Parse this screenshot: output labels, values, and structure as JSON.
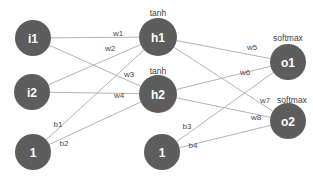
{
  "diagram": {
    "type": "neural-network-graph",
    "title": "",
    "background_color": "#ffffff",
    "node_fill_color": "#5d5d5d",
    "node_text_color": "#ffffff",
    "edge_color": "#b4b4b4",
    "label_color": "#4a4a4a",
    "nodes": [
      {
        "id": "i1",
        "label": "i1",
        "layer": "input",
        "cx": 33,
        "cy": 38,
        "r": 18
      },
      {
        "id": "i2",
        "label": "i2",
        "layer": "input",
        "cx": 32,
        "cy": 92,
        "r": 18
      },
      {
        "id": "b1",
        "label": "1",
        "layer": "bias",
        "cx": 33,
        "cy": 152,
        "r": 18
      },
      {
        "id": "h1",
        "label": "h1",
        "layer": "hidden",
        "cx": 158,
        "cy": 37,
        "r": 19
      },
      {
        "id": "h2",
        "label": "h2",
        "layer": "hidden",
        "cx": 158,
        "cy": 94,
        "r": 19
      },
      {
        "id": "b2",
        "label": "1",
        "layer": "bias",
        "cx": 162,
        "cy": 152,
        "r": 18
      },
      {
        "id": "o1",
        "label": "o1",
        "layer": "output",
        "cx": 288,
        "cy": 62,
        "r": 18
      },
      {
        "id": "o2",
        "label": "o2",
        "layer": "output",
        "cx": 288,
        "cy": 121,
        "r": 18
      }
    ],
    "activations": [
      {
        "for": "h1",
        "text": "tanh",
        "x": 158,
        "y": 13
      },
      {
        "for": "h2",
        "text": "tanh",
        "x": 158,
        "y": 71
      },
      {
        "for": "o1",
        "text": "softmax",
        "x": 288,
        "y": 38
      },
      {
        "for": "o2",
        "text": "softmax",
        "x": 292,
        "y": 100
      }
    ],
    "edges": [
      {
        "id": "w1",
        "label": "w1",
        "from": "i1",
        "to": "h1",
        "lx": 118,
        "ly": 33
      },
      {
        "id": "w2",
        "label": "w2",
        "from": "i1",
        "to": "h2",
        "lx": 110,
        "ly": 48
      },
      {
        "id": "w3",
        "label": "w3",
        "from": "i2",
        "to": "h1",
        "lx": 129,
        "ly": 74
      },
      {
        "id": "w4",
        "label": "w4",
        "from": "i2",
        "to": "h2",
        "lx": 119,
        "ly": 95
      },
      {
        "id": "w5",
        "label": "w5",
        "from": "h1",
        "to": "o1",
        "lx": 252,
        "ly": 47
      },
      {
        "id": "w6",
        "label": "w6",
        "from": "h2",
        "to": "o1",
        "lx": 245,
        "ly": 72
      },
      {
        "id": "w7",
        "label": "w7",
        "from": "h1",
        "to": "o2",
        "lx": 265,
        "ly": 100
      },
      {
        "id": "w8",
        "label": "w8",
        "from": "h2",
        "to": "o2",
        "lx": 256,
        "ly": 117
      },
      {
        "id": "b1",
        "label": "b1",
        "from": "b1",
        "to": "h1",
        "lx": 58,
        "ly": 124
      },
      {
        "id": "b2",
        "label": "b2",
        "from": "b1",
        "to": "h2",
        "lx": 64,
        "ly": 143
      },
      {
        "id": "b3",
        "label": "b3",
        "from": "b2",
        "to": "o1",
        "lx": 187,
        "ly": 126
      },
      {
        "id": "b4",
        "label": "b4",
        "from": "b2",
        "to": "o2",
        "lx": 193,
        "ly": 145
      }
    ]
  }
}
